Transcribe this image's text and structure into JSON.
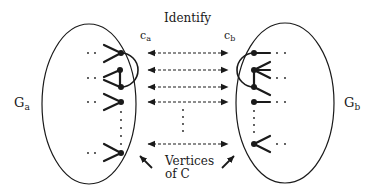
{
  "diagram": {
    "title": "Identify",
    "labels": {
      "ca_main": "c",
      "ca_sub": "a",
      "cb_main": "c",
      "cb_sub": "b",
      "ga_main": "G",
      "ga_sub": "a",
      "gb_main": "G",
      "gb_sub": "b",
      "caption_line1": "Vertices",
      "caption_line2": "of C"
    },
    "nodes": [
      {
        "id": "Ga",
        "shape": "ellipse",
        "label": "Ga"
      },
      {
        "id": "Gb",
        "shape": "ellipse",
        "label": "Gb"
      },
      {
        "id": "ca1",
        "graph": "Ga"
      },
      {
        "id": "ca2",
        "graph": "Ga"
      },
      {
        "id": "ca3",
        "graph": "Ga"
      },
      {
        "id": "ca4",
        "graph": "Ga"
      },
      {
        "id": "ca5",
        "graph": "Ga"
      },
      {
        "id": "cb1",
        "graph": "Gb"
      },
      {
        "id": "cb2",
        "graph": "Gb"
      },
      {
        "id": "cb3",
        "graph": "Gb"
      },
      {
        "id": "cb4",
        "graph": "Gb"
      },
      {
        "id": "cb5",
        "graph": "Gb"
      }
    ],
    "edges": [
      {
        "from": "ca1",
        "to": "cb1",
        "style": "dashed",
        "arrows": "both"
      },
      {
        "from": "ca2",
        "to": "cb2",
        "style": "dashed",
        "arrows": "both"
      },
      {
        "from": "ca3",
        "to": "cb3",
        "style": "dashed",
        "arrows": "both"
      },
      {
        "from": "ca4",
        "to": "cb4",
        "style": "dashed",
        "arrows": "both"
      },
      {
        "from": "ca5",
        "to": "cb5",
        "style": "dashed",
        "arrows": "both"
      }
    ],
    "colors": {
      "ink": "#1a1a1a",
      "background": "#ffffff"
    }
  }
}
